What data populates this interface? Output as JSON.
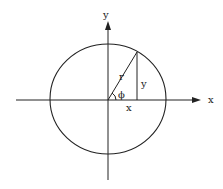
{
  "diagram": {
    "type": "polar-coordinates-unit-circle",
    "labels": {
      "y_axis": "y",
      "x_axis": "x",
      "radius": "r",
      "opposite": "y",
      "adjacent": "x",
      "angle": "ϕ"
    },
    "colors": {
      "stroke": "#222222",
      "background": "#ffffff"
    }
  }
}
